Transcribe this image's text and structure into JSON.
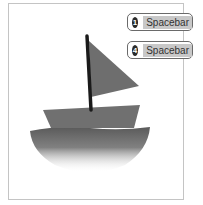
{
  "illustration": {
    "subject": "sailboat",
    "colors": {
      "frame_border": "#c4c4c4",
      "mast": "#1a1a1a",
      "sail": "#6e6e6e",
      "hull": "#707070",
      "water": "#5a5a5a"
    }
  },
  "badges": [
    {
      "number": "1",
      "label": "Spacebar"
    },
    {
      "number": "4",
      "label": "Spacebar"
    }
  ]
}
